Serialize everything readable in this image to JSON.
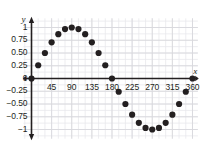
{
  "chart_data": {
    "type": "scatter",
    "title": "",
    "xlabel": "x",
    "ylabel": "y",
    "xlim": [
      -20,
      375
    ],
    "ylim": [
      -1.18,
      1.18
    ],
    "xticks": [
      45,
      90,
      135,
      180,
      225,
      270,
      315,
      360
    ],
    "xticklabels": [
      "45",
      "90",
      "135",
      "180",
      "225",
      "270",
      "315",
      "360"
    ],
    "yticks": [
      1,
      0.75,
      0.5,
      0.25,
      0,
      -0.25,
      -0.5,
      -0.75,
      -1
    ],
    "yticklabels": [
      "1",
      "0.75",
      "0.50",
      "0.25",
      "0",
      "−0.25",
      "−0.50",
      "−0.75",
      "−1"
    ],
    "grid": true,
    "grid_minor_step_x": 15,
    "grid_minor_step_y": 0.125,
    "legend": null,
    "series": [
      {
        "name": "sin(x)",
        "marker": "filled-circle",
        "color": "#231f20",
        "x": [
          0,
          15,
          30,
          45,
          60,
          75,
          90,
          105,
          120,
          135,
          150,
          165,
          180,
          195,
          210,
          225,
          240,
          255,
          270,
          285,
          300,
          315,
          330,
          345,
          360
        ],
        "y": [
          0,
          0.26,
          0.5,
          0.71,
          0.87,
          0.97,
          1,
          0.97,
          0.87,
          0.71,
          0.5,
          0.26,
          0,
          -0.26,
          -0.5,
          -0.71,
          -0.87,
          -0.97,
          -1,
          -0.97,
          -0.87,
          -0.71,
          -0.5,
          -0.26,
          0
        ]
      }
    ]
  },
  "axes": {
    "x_axis_name": "x",
    "y_axis_name": "y"
  },
  "colors": {
    "marker": "#231f20",
    "axis": "#231f20",
    "grid_minor": "#e9e9ec",
    "grid_major": "#d8d8dd",
    "background": "#ffffff"
  }
}
